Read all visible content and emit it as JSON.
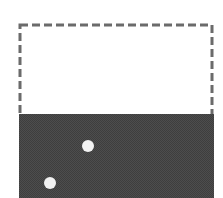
{
  "canvas": {
    "width": 223,
    "height": 198,
    "background": "#ffffff"
  },
  "dashed_box": {
    "x": 20,
    "y": 25,
    "width": 192,
    "height": 92,
    "stroke": "#6b6b6b",
    "stroke_width": 3,
    "dash": "8,4"
  },
  "filled_region": {
    "x": 19,
    "y": 114,
    "width": 195,
    "height": 84,
    "fill": "#4d4d4d",
    "texture": "#3e3e3e"
  },
  "dots": [
    {
      "cx": 88,
      "cy": 146,
      "r": 6,
      "fill": "#f2f2f2"
    },
    {
      "cx": 50,
      "cy": 183,
      "r": 6,
      "fill": "#f2f2f2"
    }
  ]
}
